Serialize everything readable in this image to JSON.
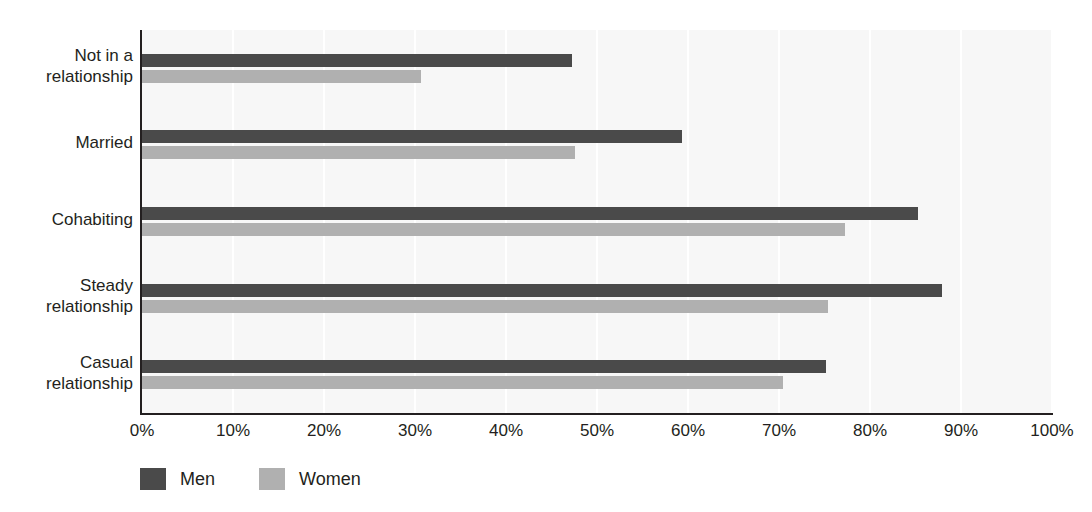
{
  "chart_data": {
    "type": "bar",
    "orientation": "horizontal",
    "grouped": true,
    "title": "",
    "subtitle": "",
    "xlabel": "",
    "ylabel": "",
    "xlim": [
      0,
      100
    ],
    "xticks": [
      "0%",
      "10%",
      "20%",
      "30%",
      "40%",
      "50%",
      "60%",
      "70%",
      "80%",
      "90%",
      "100%"
    ],
    "xtick_values": [
      0,
      10,
      20,
      30,
      40,
      50,
      60,
      70,
      80,
      90,
      100
    ],
    "grid": "vertical",
    "legend_position": "bottom-left",
    "categories": [
      "Not in a relationship",
      "Married",
      "Cohabiting",
      "Steady relationship",
      "Casual relationship"
    ],
    "category_lines": [
      [
        "Not in a",
        "relationship"
      ],
      [
        "Married"
      ],
      [
        "Cohabiting"
      ],
      [
        "Steady",
        "relationship"
      ],
      [
        "Casual",
        "relationship"
      ]
    ],
    "series": [
      {
        "name": "Men",
        "color": "#4a4a4a",
        "values": [
          47.3,
          59.3,
          85.3,
          87.9,
          75.2
        ]
      },
      {
        "name": "Women",
        "color": "#b0b0b0",
        "values": [
          30.7,
          47.6,
          77.2,
          75.4,
          70.4
        ]
      }
    ]
  },
  "legend": {
    "items": [
      {
        "label": "Men",
        "color": "#4a4a4a"
      },
      {
        "label": "Women",
        "color": "#b0b0b0"
      }
    ]
  },
  "colors": {
    "men": "#4a4a4a",
    "women": "#b0b0b0",
    "plot_background": "#f7f7f7",
    "gridline": "#ffffff",
    "axis": "#231f20",
    "text": "#231f20"
  }
}
